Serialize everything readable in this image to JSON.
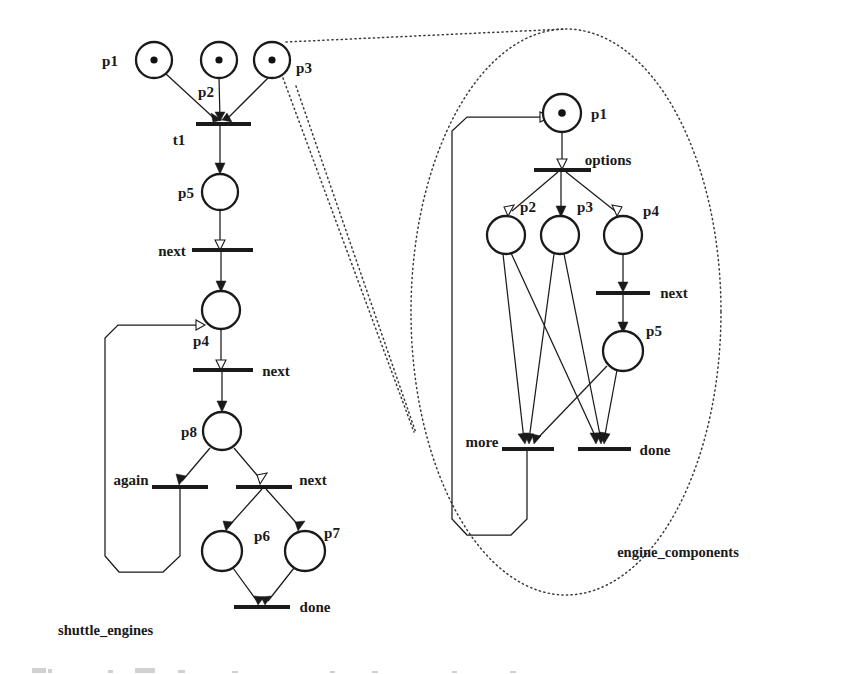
{
  "figure": {
    "caption_partial": ""
  },
  "modules": [
    {
      "id": "shuttle_engines",
      "label": "shuttle_engines"
    },
    {
      "id": "engine_components",
      "label": "engine_components"
    }
  ],
  "left_net": {
    "name": "shuttle_engines",
    "places": [
      {
        "id": "p1",
        "label": "p1",
        "tokens": 1
      },
      {
        "id": "p2",
        "label": "p2",
        "tokens": 1
      },
      {
        "id": "p3",
        "label": "p3",
        "tokens": 1
      },
      {
        "id": "p5",
        "label": "p5",
        "tokens": 0
      },
      {
        "id": "p4",
        "label": "p4",
        "tokens": 0
      },
      {
        "id": "p8",
        "label": "p8",
        "tokens": 0
      },
      {
        "id": "p6",
        "label": "p6",
        "tokens": 0
      },
      {
        "id": "p7",
        "label": "p7",
        "tokens": 0
      }
    ],
    "transitions": [
      {
        "id": "t1",
        "label": "t1"
      },
      {
        "id": "next1",
        "label": "next"
      },
      {
        "id": "next2",
        "label": "next"
      },
      {
        "id": "again",
        "label": "again"
      },
      {
        "id": "next3",
        "label": "next"
      },
      {
        "id": "done",
        "label": "done"
      }
    ]
  },
  "right_net": {
    "name": "engine_components",
    "places": [
      {
        "id": "rp1",
        "label": "p1",
        "tokens": 1
      },
      {
        "id": "rp2",
        "label": "p2",
        "tokens": 0
      },
      {
        "id": "rp3",
        "label": "p3",
        "tokens": 0
      },
      {
        "id": "rp4",
        "label": "p4",
        "tokens": 0
      },
      {
        "id": "rp5",
        "label": "p5",
        "tokens": 0
      }
    ],
    "transitions": [
      {
        "id": "options",
        "label": "options"
      },
      {
        "id": "rnext",
        "label": "next"
      },
      {
        "id": "more",
        "label": "more"
      },
      {
        "id": "rdone",
        "label": "done"
      }
    ]
  },
  "labels": {
    "p1": "p1",
    "p2": "p2",
    "p3": "p3",
    "p4": "p4",
    "p5": "p5",
    "p6": "p6",
    "p7": "p7",
    "p8": "p8",
    "t1": "t1",
    "next": "next",
    "again": "again",
    "done": "done",
    "options": "options",
    "more": "more",
    "shuttle_engines": "shuttle_engines",
    "engine_components": "engine_components"
  },
  "colors": {
    "ink": "#1a1a1a",
    "paper": "#ffffff",
    "dotted": "#3a3a3a"
  }
}
